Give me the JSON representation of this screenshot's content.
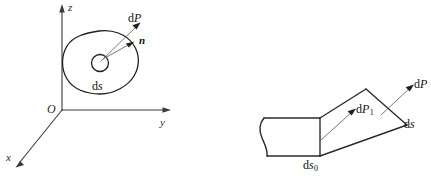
{
  "figure": {
    "background_color": "#ffffff",
    "ink_color": "#1f1f1f",
    "leader_color": "#6a6a6a",
    "width_px": 431,
    "height_px": 180
  },
  "left_diagram": {
    "name": "coordinate-frame-with-surface-element",
    "axes": {
      "origin_label": "O",
      "z_label": "z",
      "y_label": "y",
      "x_label": "x"
    },
    "labels": {
      "force": "dP",
      "normal": "n",
      "area_element": "ds"
    },
    "area_element_symbol": {
      "d": "d",
      "var": "s"
    },
    "force_symbol": {
      "d": "d",
      "var": "P"
    }
  },
  "right_diagram": {
    "name": "body-segment-wedge",
    "labels": {
      "force_interior": "dP",
      "force_interior_subscript": "1",
      "force_outer": "dP",
      "force_outer_subscript": "",
      "area_front": "ds",
      "area_front_subscript": "0",
      "area_slant": "ds"
    }
  }
}
